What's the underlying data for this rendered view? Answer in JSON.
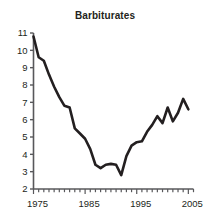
{
  "chart_data": {
    "type": "line",
    "title": "Barbiturates",
    "xlabel": "",
    "ylabel": "",
    "xlim": [
      1975,
      2006
    ],
    "ylim": [
      2,
      11
    ],
    "grid": false,
    "legend": null,
    "y_ticks": [
      2,
      3,
      4,
      5,
      6,
      7,
      8,
      9,
      10,
      11
    ],
    "y_tick_labels": [
      "2",
      "3",
      "4",
      "5",
      "6",
      "7",
      "8",
      "9",
      "10",
      "11"
    ],
    "x_ticks": [
      1975,
      1985,
      1995,
      2005
    ],
    "x_tick_labels": [
      "1975",
      "1985",
      "1995",
      "2005"
    ],
    "x_minor_tick_interval": 1,
    "line_color": "#231f20",
    "line_width": 2.6,
    "x": [
      1975,
      1976,
      1977,
      1978,
      1979,
      1980,
      1981,
      1982,
      1983,
      1984,
      1985,
      1986,
      1987,
      1988,
      1989,
      1990,
      1991,
      1992,
      1993,
      1994,
      1995,
      1996,
      1997,
      1998,
      1999,
      2000,
      2001,
      2002,
      2003,
      2004,
      2005
    ],
    "values": [
      10.8,
      9.6,
      9.4,
      8.6,
      7.9,
      7.3,
      6.8,
      6.7,
      5.5,
      5.2,
      4.9,
      4.3,
      3.4,
      3.2,
      3.4,
      3.45,
      3.4,
      2.8,
      3.9,
      4.5,
      4.7,
      4.75,
      5.3,
      5.7,
      6.2,
      5.8,
      6.7,
      5.9,
      6.4,
      7.2,
      6.6
    ],
    "series": [
      {
        "name": "Barbiturates",
        "values": [
          10.8,
          9.6,
          9.4,
          8.6,
          7.9,
          7.3,
          6.8,
          6.7,
          5.5,
          5.2,
          4.9,
          4.3,
          3.4,
          3.2,
          3.4,
          3.45,
          3.4,
          2.8,
          3.9,
          4.5,
          4.7,
          4.75,
          5.3,
          5.7,
          6.2,
          5.8,
          6.7,
          5.9,
          6.4,
          7.2,
          6.6
        ]
      }
    ]
  }
}
